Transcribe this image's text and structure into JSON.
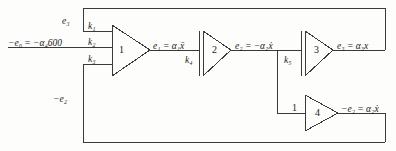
{
  "diagram": {
    "line_color": "#3a3a3a",
    "text_color": "#1b1b1b",
    "background": "#fdfdfc",
    "input": {
      "label": "−e₀ = −α₄600",
      "name": "input-signal-label"
    },
    "amplifiers": [
      {
        "id": "1",
        "number": "1",
        "inputs": [
          "k₁",
          "k₂",
          "k₃"
        ],
        "output": "e₁ = α₁ẍ"
      },
      {
        "id": "2",
        "number": "2",
        "inputs": [
          "k₄"
        ],
        "output": "e₂ = −α₂ẋ"
      },
      {
        "id": "3",
        "number": "3",
        "inputs": [
          "k₅"
        ],
        "output": "e₃ = α₃x"
      },
      {
        "id": "4",
        "number": "4",
        "inputs": [
          "1"
        ],
        "output": "−e₂ = α₂ẋ"
      }
    ],
    "feedback": {
      "top_label": "e₃",
      "bottom_label": "−e₂"
    },
    "wire_labels": {
      "k1": "k₁",
      "k2": "k₂",
      "k3": "k₃",
      "k4": "k₄",
      "k5": "k₅",
      "unity": "1"
    },
    "outputs": {
      "amp1": "e₁ = α₁ẍ",
      "amp2": "e₂ = −α₂ẋ",
      "amp3": "e₃ = α₃x",
      "amp4": "−e₂ = α₂ẋ"
    }
  }
}
